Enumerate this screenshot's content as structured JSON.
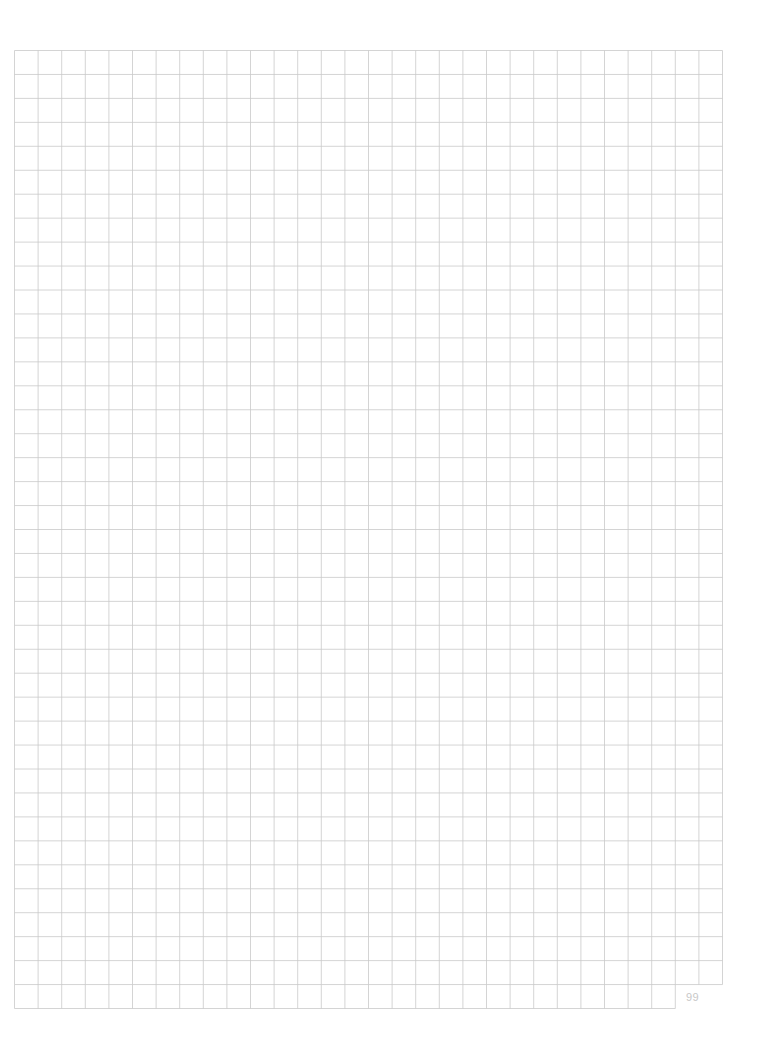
{
  "page": {
    "type": "graph-paper",
    "page_number": "99",
    "grid": {
      "left": 14.5,
      "top": 50.5,
      "cell_w": 23.6,
      "cell_h": 23.95,
      "cols": 30,
      "rows": 39,
      "last_row_cols": 28,
      "line_color": "#c9c9c9",
      "line_width": 0.8
    }
  }
}
